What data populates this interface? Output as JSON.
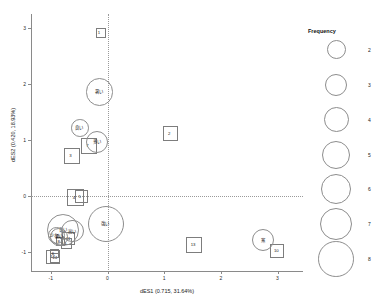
{
  "chart_data": {
    "type": "scatter",
    "title": "",
    "subtitle": "",
    "xlabel": "dES1 (0.715, 31.64%)",
    "ylabel": "dES2 (0.420, 18.93%)",
    "xlim": [
      -1.35,
      3.45
    ],
    "ylim": [
      -1.35,
      3.25
    ],
    "xticks": [
      "-1",
      "0",
      "1",
      "2",
      "3"
    ],
    "xtick_values": [
      -1,
      0,
      1,
      2,
      3
    ],
    "yticks": [
      "-1",
      "0",
      "1",
      "2",
      "3"
    ],
    "ytick_values": [
      -1,
      0,
      1,
      2,
      3
    ],
    "grid": false,
    "reference_lines": {
      "horizontal": 0,
      "vertical": 0,
      "style": "dotted"
    },
    "legend": {
      "position": "right",
      "title": "Frequency",
      "entries": [
        {
          "value": "2",
          "radius_px": 9.5
        },
        {
          "value": "3",
          "radius_px": 11.0
        },
        {
          "value": "4",
          "radius_px": 12.5
        },
        {
          "value": "5",
          "radius_px": 14.0
        },
        {
          "value": "6",
          "radius_px": 15.2
        },
        {
          "value": "7",
          "radius_px": 16.4
        },
        {
          "value": "8",
          "radius_px": 17.8
        }
      ]
    },
    "series": [
      {
        "name": "Categories (squares)",
        "marker": "square",
        "points": [
          {
            "label": "1",
            "x": -0.12,
            "y": 2.92,
            "size": 5.0
          },
          {
            "label": "2",
            "x": 1.12,
            "y": 1.12,
            "size": 7.5
          },
          {
            "label": "3",
            "x": -0.62,
            "y": 0.72,
            "size": 8.0
          },
          {
            "label": "7",
            "x": -0.32,
            "y": 0.9,
            "size": 8.0
          },
          {
            "label": "4",
            "x": -0.56,
            "y": -0.02,
            "size": 8.5
          },
          {
            "label": "5",
            "x": -0.46,
            "y": -0.01,
            "size": 6.5
          },
          {
            "label": "11",
            "x": -0.68,
            "y": -0.76,
            "size": 6.5
          },
          {
            "label": "9",
            "x": -0.72,
            "y": -0.84,
            "size": 5.5
          },
          {
            "label": "8",
            "x": -0.83,
            "y": -0.8,
            "size": 4.5
          },
          {
            "label": "12",
            "x": -0.96,
            "y": -1.08,
            "size": 7.0
          },
          {
            "label": "14",
            "x": -0.92,
            "y": -1.1,
            "size": 5.0
          },
          {
            "label": "6",
            "x": -0.93,
            "y": -1.02,
            "size": 4.5
          },
          {
            "label": "13",
            "x": 1.52,
            "y": -0.86,
            "size": 8.0
          },
          {
            "label": "10",
            "x": 2.99,
            "y": -0.97,
            "size": 7.0
          }
        ]
      },
      {
        "name": "Terms (circles)",
        "marker": "circle",
        "points": [
          {
            "label": "暑い",
            "x": -0.14,
            "y": 1.86,
            "freq": 5
          },
          {
            "label": "良い",
            "x": -0.49,
            "y": 1.22,
            "freq": 3
          },
          {
            "label": "多い",
            "x": -0.18,
            "y": 0.97,
            "freq": 4
          },
          {
            "label": "強い",
            "x": -0.03,
            "y": -0.49,
            "freq": 7
          },
          {
            "label": "長い",
            "x": -0.78,
            "y": -0.6,
            "freq": 6
          },
          {
            "label": "高い",
            "x": -0.62,
            "y": -0.62,
            "freq": 4
          },
          {
            "label": "悪い",
            "x": -0.85,
            "y": -0.72,
            "freq": 3
          },
          {
            "label": "少ない",
            "x": -0.9,
            "y": -0.7,
            "freq": 3
          },
          {
            "label": "寒",
            "x": 2.74,
            "y": -0.78,
            "freq": 4
          }
        ]
      }
    ]
  }
}
